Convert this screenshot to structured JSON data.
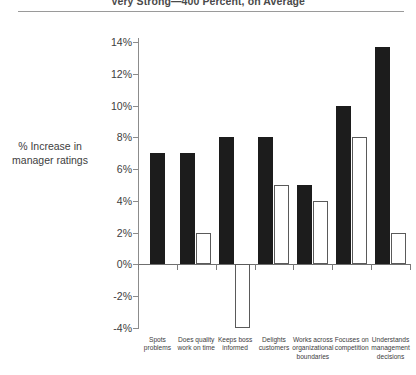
{
  "chart_data": {
    "type": "bar",
    "title": "Very Strong—400 Percent, on Average",
    "subtitle": "",
    "xlabel": "",
    "ylabel": "% Increase in manager ratings",
    "ylim": [
      -4,
      14
    ],
    "ytick_values": [
      14,
      12,
      10,
      8,
      6,
      4,
      2,
      0,
      -2,
      -4
    ],
    "ytick_labels": [
      "14%",
      "12%",
      "10%",
      "8%",
      "6%",
      "4%",
      "2%",
      "0%",
      "-2%",
      "-4%"
    ],
    "grid": false,
    "legend_position": "none",
    "categories": [
      "Spots problems",
      "Does quality work on time",
      "Keeps boss informed",
      "Delights customers",
      "Works across organizational boundaries",
      "Focuses on competition",
      "Understands management decisions"
    ],
    "category_lines": [
      [
        "Spots",
        "problems"
      ],
      [
        "Does quality",
        "work on time"
      ],
      [
        "Keeps boss",
        "informed"
      ],
      [
        "Delights",
        "customers"
      ],
      [
        "Works across",
        "organizational",
        "boundaries"
      ],
      [
        "Focuses on",
        "competition"
      ],
      [
        "Understands",
        "management",
        "decisions"
      ]
    ],
    "series": [
      {
        "name": "series-dark",
        "color": "#1c1c1c",
        "style": "filled",
        "values": [
          7,
          7,
          8,
          8,
          5,
          10,
          13.7
        ]
      },
      {
        "name": "series-light",
        "color": "#ffffff",
        "style": "outlined",
        "values": [
          null,
          2,
          -4,
          5,
          4,
          8,
          2
        ]
      }
    ]
  }
}
